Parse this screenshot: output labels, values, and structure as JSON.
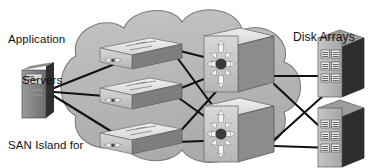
{
  "diagram": {
    "type": "network-topology",
    "title": "SAN Island for Department #1",
    "canvas": {
      "width": 370,
      "height": 168
    },
    "colors": {
      "background": "#ffffff",
      "cloud_fill": "#b8b8b8",
      "cloud_stroke": "#6e6e6e",
      "link": "#111111",
      "text": "#111111",
      "device_top": "#e8e8e8",
      "device_face": "#c9c9c9",
      "device_side": "#6a6a6a",
      "device_dark": "#3a3a3a",
      "icon_light": "#f2f2f2"
    },
    "labels": [
      {
        "id": "app-servers",
        "line1": "Application",
        "line2": "Servers"
      },
      {
        "id": "san-island",
        "line1": "SAN Island for",
        "line2": "Department #1"
      },
      {
        "id": "disk-arrays",
        "line1": "Disk Arrays",
        "line2": ""
      }
    ],
    "cloud": {
      "name": "san-island-cloud",
      "label_ref": "san-island",
      "cx": 185,
      "cy": 88,
      "rx": 128,
      "ry": 76
    },
    "nodes": [
      {
        "id": "server-1",
        "name": "application-server",
        "kind": "server-tower",
        "x": 30,
        "y": 72,
        "w": 24,
        "h": 46,
        "group": "application-servers"
      },
      {
        "id": "edge-sw-1",
        "name": "edge-switch-1",
        "kind": "workgroup-switch",
        "x": 126,
        "y": 46,
        "w": 56,
        "h": 30,
        "group": "edge-switches"
      },
      {
        "id": "edge-sw-2",
        "name": "edge-switch-2",
        "kind": "workgroup-switch",
        "x": 126,
        "y": 85,
        "w": 56,
        "h": 30,
        "group": "edge-switches"
      },
      {
        "id": "edge-sw-3",
        "name": "edge-switch-3",
        "kind": "workgroup-switch",
        "x": 126,
        "y": 131,
        "w": 56,
        "h": 30,
        "group": "edge-switches"
      },
      {
        "id": "dir-sw-1",
        "name": "director-switch-1",
        "kind": "director-switch",
        "x": 228,
        "y": 53,
        "w": 48,
        "h": 46,
        "group": "director-switches"
      },
      {
        "id": "dir-sw-2",
        "name": "director-switch-2",
        "kind": "director-switch",
        "x": 228,
        "y": 123,
        "w": 48,
        "h": 46,
        "group": "director-switches"
      },
      {
        "id": "disk-arr-1",
        "name": "disk-array-1",
        "kind": "disk-array",
        "x": 332,
        "y": 56,
        "w": 32,
        "h": 50,
        "group": "disk-arrays",
        "modules": 6,
        "module_cols": 2,
        "module_rows": 3
      },
      {
        "id": "disk-arr-2",
        "name": "disk-array-2",
        "kind": "disk-array",
        "x": 332,
        "y": 126,
        "w": 32,
        "h": 50,
        "group": "disk-arrays",
        "modules": 6,
        "module_cols": 2,
        "module_rows": 3
      }
    ],
    "links": [
      {
        "from": "server-1",
        "to": "edge-sw-1"
      },
      {
        "from": "server-1",
        "to": "edge-sw-2"
      },
      {
        "from": "server-1",
        "to": "edge-sw-3"
      },
      {
        "from": "edge-sw-1",
        "to": "dir-sw-1"
      },
      {
        "from": "edge-sw-1",
        "to": "dir-sw-2"
      },
      {
        "from": "edge-sw-2",
        "to": "dir-sw-1"
      },
      {
        "from": "edge-sw-2",
        "to": "dir-sw-2"
      },
      {
        "from": "edge-sw-3",
        "to": "dir-sw-1"
      },
      {
        "from": "edge-sw-3",
        "to": "dir-sw-2"
      },
      {
        "from": "dir-sw-1",
        "to": "disk-arr-1"
      },
      {
        "from": "dir-sw-1",
        "to": "disk-arr-2"
      },
      {
        "from": "dir-sw-2",
        "to": "disk-arr-1"
      },
      {
        "from": "dir-sw-2",
        "to": "disk-arr-2"
      }
    ]
  }
}
